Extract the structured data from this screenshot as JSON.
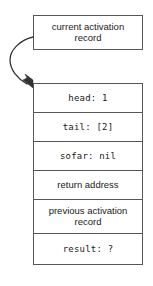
{
  "diagram": {
    "caption": {
      "label": "current activation\nrecord"
    },
    "pointer": {
      "icon": "curved-arrow-icon",
      "description": "curved arrow from caption box to activation record"
    },
    "activation_record": {
      "rows": [
        {
          "label": "head: 1",
          "style": "mono",
          "height": "single"
        },
        {
          "label": "tail: [2]",
          "style": "mono",
          "height": "single"
        },
        {
          "label": "sofar: nil",
          "style": "mono",
          "height": "single"
        },
        {
          "label": "return address",
          "style": "sans",
          "height": "single"
        },
        {
          "label": "previous activation\nrecord",
          "style": "sans",
          "height": "double"
        },
        {
          "label": "result: ?",
          "style": "mono",
          "height": "last"
        }
      ]
    },
    "colors": {
      "stroke": "#555555",
      "text": "#1a1a1a",
      "background": "#ffffff"
    }
  }
}
